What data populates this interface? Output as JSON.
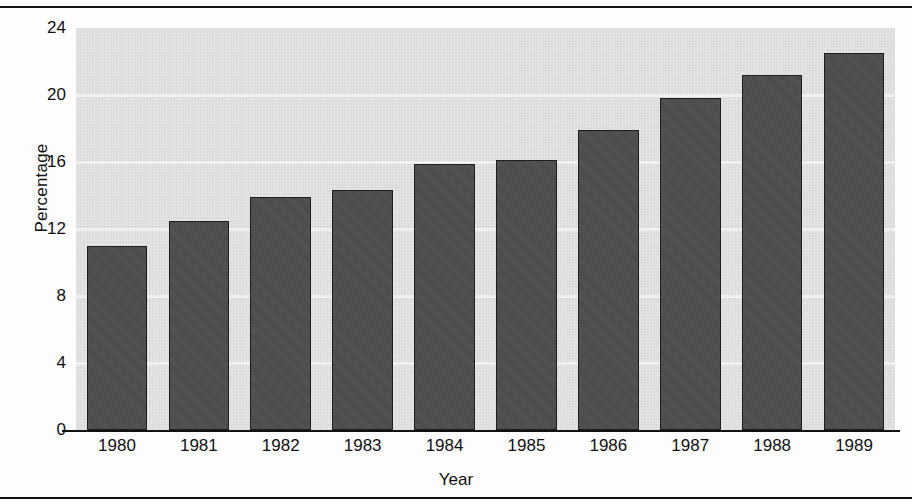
{
  "chart_data": {
    "type": "bar",
    "title": "",
    "xlabel": "Year",
    "ylabel": "Percentage",
    "categories": [
      "1980",
      "1981",
      "1982",
      "1983",
      "1984",
      "1985",
      "1986",
      "1987",
      "1988",
      "1989"
    ],
    "values": [
      11.0,
      12.5,
      13.9,
      14.3,
      15.9,
      16.1,
      17.9,
      19.8,
      21.2,
      22.5
    ],
    "ylim": [
      0,
      24
    ],
    "yticks": [
      0,
      4,
      8,
      12,
      16,
      20,
      24
    ],
    "ytick_labels": [
      "0",
      "4",
      "8",
      "12",
      "16",
      "20",
      "24"
    ],
    "grid": true,
    "grid_axis": "y",
    "legend": false,
    "legend_position": "none",
    "series": [
      {
        "name": "Percentage",
        "values": [
          11.0,
          12.5,
          13.9,
          14.3,
          15.9,
          16.1,
          17.9,
          19.8,
          21.2,
          22.5
        ]
      }
    ],
    "colors": {
      "bar_fill": "#4d4d4d",
      "bar_edge": "#1e1e1e",
      "plot_background": "#e3e3e3",
      "gridline": "#f4f4f4",
      "axis": "#111111",
      "text": "#111111"
    }
  }
}
